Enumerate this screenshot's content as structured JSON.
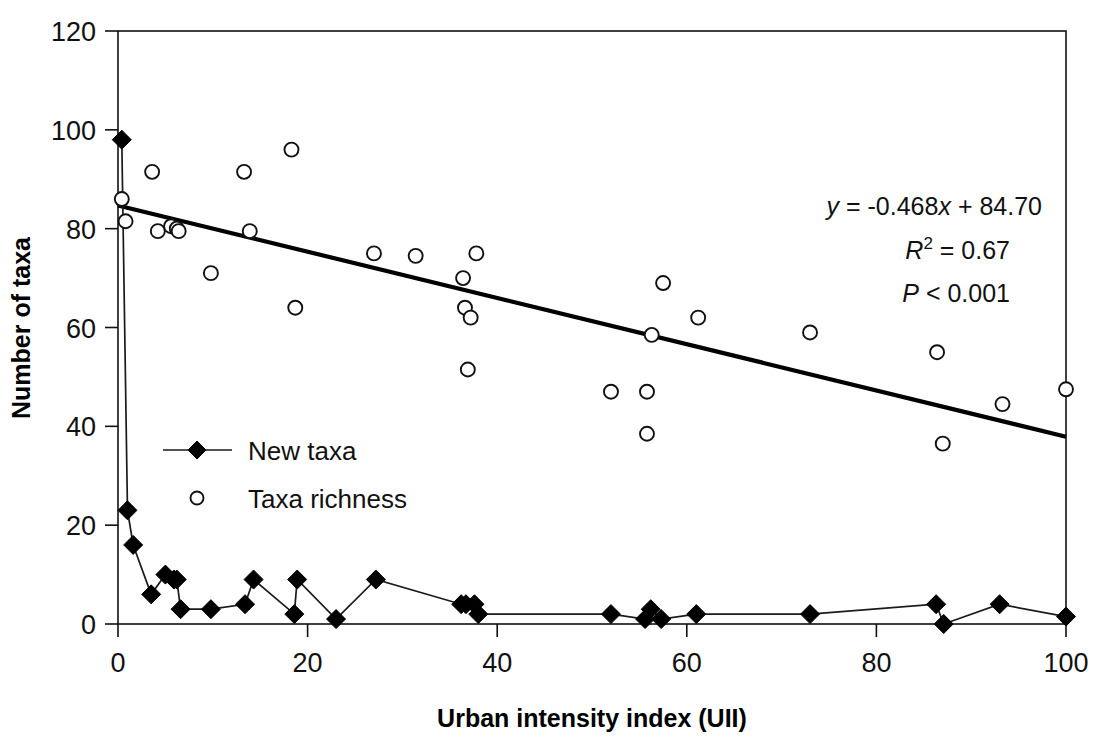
{
  "chart_data": {
    "type": "scatter",
    "title": "",
    "xlabel": "Urban intensity index (UII)",
    "ylabel": "Number of taxa",
    "xlim": [
      0,
      100
    ],
    "ylim": [
      0,
      120
    ],
    "xticks": [
      0,
      20,
      40,
      60,
      80,
      100
    ],
    "yticks": [
      0,
      20,
      40,
      60,
      80,
      100,
      120
    ],
    "xtick_labels": [
      "0",
      "20",
      "40",
      "60",
      "80",
      "100"
    ],
    "ytick_labels": [
      "0",
      "20",
      "40",
      "60",
      "80",
      "100",
      "120"
    ],
    "grid": false,
    "legend_position": "center-left-inside",
    "series": [
      {
        "name": "New taxa",
        "marker": "filled-diamond",
        "line": true,
        "points": [
          [
            0.4,
            98
          ],
          [
            1.0,
            23
          ],
          [
            1.6,
            16
          ],
          [
            3.5,
            6
          ],
          [
            5.0,
            10
          ],
          [
            5.9,
            9
          ],
          [
            6.2,
            9
          ],
          [
            6.6,
            3
          ],
          [
            9.8,
            3
          ],
          [
            13.4,
            4
          ],
          [
            14.3,
            9
          ],
          [
            18.6,
            2
          ],
          [
            18.9,
            9
          ],
          [
            23.0,
            1
          ],
          [
            27.2,
            9
          ],
          [
            36.2,
            4
          ],
          [
            36.7,
            4
          ],
          [
            37.6,
            4
          ],
          [
            38.0,
            2
          ],
          [
            52.0,
            2
          ],
          [
            55.6,
            1
          ],
          [
            56.2,
            3
          ],
          [
            57.3,
            1
          ],
          [
            61.0,
            2
          ],
          [
            73.0,
            2
          ],
          [
            86.3,
            4
          ],
          [
            87.1,
            0
          ],
          [
            93.0,
            4
          ],
          [
            100.0,
            1.5
          ]
        ]
      },
      {
        "name": "Taxa richness",
        "marker": "open-circle",
        "line": false,
        "points": [
          [
            0.4,
            86
          ],
          [
            0.8,
            81.5
          ],
          [
            3.6,
            91.5
          ],
          [
            4.2,
            79.5
          ],
          [
            5.6,
            80.5
          ],
          [
            6.2,
            80
          ],
          [
            6.4,
            79.5
          ],
          [
            9.8,
            71
          ],
          [
            13.3,
            91.5
          ],
          [
            13.9,
            79.5
          ],
          [
            18.3,
            96
          ],
          [
            18.7,
            64
          ],
          [
            27.0,
            75
          ],
          [
            31.4,
            74.5
          ],
          [
            36.4,
            70
          ],
          [
            36.6,
            64
          ],
          [
            37.2,
            62
          ],
          [
            36.9,
            51.5
          ],
          [
            37.8,
            75
          ],
          [
            52.0,
            47
          ],
          [
            55.8,
            47
          ],
          [
            56.3,
            58.5
          ],
          [
            55.8,
            38.5
          ],
          [
            57.5,
            69
          ],
          [
            61.2,
            62
          ],
          [
            73.0,
            59
          ],
          [
            86.4,
            55
          ],
          [
            87.0,
            36.5
          ],
          [
            93.3,
            44.5
          ],
          [
            100.0,
            47.5
          ]
        ]
      }
    ],
    "trend_line": {
      "slope": -0.468,
      "intercept": 84.7,
      "x_start": 0,
      "x_end": 100,
      "y_start": 84.7,
      "y_end": 37.9
    },
    "annotations": {
      "equation_y": "y",
      "equation_rest": " = -0.468",
      "equation_x": "x",
      "equation_tail": " + 84.70",
      "r_symbol": "R",
      "r_exponent": "2",
      "r_value": " = 0.67",
      "p_symbol": "P",
      "p_value": " < 0.001",
      "equation_full": "y = -0.468x + 84.70",
      "r_squared_full": "R2 = 0.67",
      "p_full": "P < 0.001"
    },
    "legend": [
      {
        "label": "New taxa",
        "marker": "filled-diamond-with-line"
      },
      {
        "label": "Taxa richness",
        "marker": "open-circle"
      }
    ],
    "colors": {
      "marker_stroke": "#111111",
      "marker_fill_open": "#ffffff",
      "marker_fill_closed": "#000000",
      "trend_line": "#000000",
      "axis": "#111111",
      "background": "#ffffff"
    }
  }
}
